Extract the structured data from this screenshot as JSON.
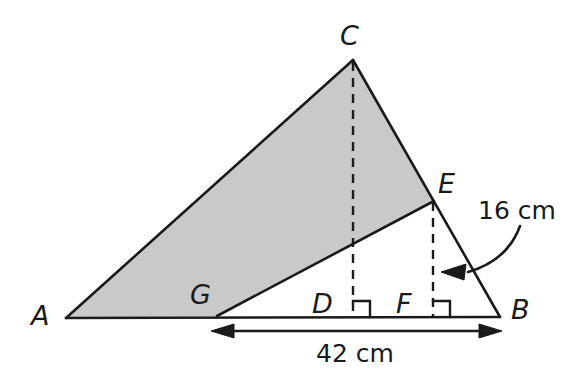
{
  "figure": {
    "canvas": {
      "width": 587,
      "height": 375,
      "background": "#ffffff"
    },
    "colors": {
      "stroke": "#1a1a1a",
      "shaded_fill": "#c9c9c9",
      "text": "#1a1a1a",
      "background": "#ffffff"
    }
  },
  "points": {
    "A": {
      "label": "A",
      "x": 66,
      "y": 318,
      "label_x": 31,
      "label_y": 302
    },
    "B": {
      "label": "B",
      "x": 500,
      "y": 317,
      "label_x": 511,
      "label_y": 296
    },
    "C": {
      "label": "C",
      "x": 353,
      "y": 60,
      "label_x": 340,
      "label_y": 22
    },
    "D": {
      "label": "D",
      "x": 353,
      "y": 317,
      "label_x": 312,
      "label_y": 290
    },
    "E": {
      "label": "E",
      "x": 434,
      "y": 201,
      "label_x": 438,
      "label_y": 170
    },
    "F": {
      "label": "F",
      "x": 433,
      "y": 317,
      "label_x": 396,
      "label_y": 290
    },
    "G": {
      "label": "G",
      "x": 217,
      "y": 316,
      "label_x": 190,
      "label_y": 281
    }
  },
  "shaded_region": {
    "name": "quadrilateral-ACEG",
    "vertices": [
      "A",
      "C",
      "E",
      "G"
    ],
    "fill": "#c9c9c9"
  },
  "segments": [
    {
      "name": "segment-AB",
      "from": "A",
      "to": "B",
      "style": "solid"
    },
    {
      "name": "segment-AC",
      "from": "A",
      "to": "C",
      "style": "solid"
    },
    {
      "name": "segment-CB",
      "from": "C",
      "to": "B",
      "style": "solid"
    },
    {
      "name": "segment-GE",
      "from": "G",
      "to": "E",
      "style": "solid"
    },
    {
      "name": "segment-CD",
      "from": "C",
      "to": "D",
      "style": "dashed"
    },
    {
      "name": "segment-EF",
      "from": "E",
      "to": "F",
      "style": "dashed"
    }
  ],
  "right_angles": [
    {
      "name": "right-angle-at-D",
      "at": "D"
    },
    {
      "name": "right-angle-at-F",
      "at": "F"
    }
  ],
  "measurements": [
    {
      "name": "height-EF",
      "text": "16 cm",
      "value": 16,
      "unit": "cm",
      "label_x": 478,
      "label_y": 198,
      "annotation": "curved-arrow pointing to segment EF"
    },
    {
      "name": "base-GB",
      "text": "42 cm",
      "value": 42,
      "unit": "cm",
      "label_x": 316,
      "label_y": 341,
      "annotation": "double-headed dimension arrow from G to B"
    }
  ],
  "icons": {
    "arrow_left_head": "arrowhead-left-icon",
    "arrow_right_head": "arrowhead-right-icon",
    "curved_arrow": "curved-arrow-icon",
    "right_angle_mark": "right-angle-icon"
  }
}
